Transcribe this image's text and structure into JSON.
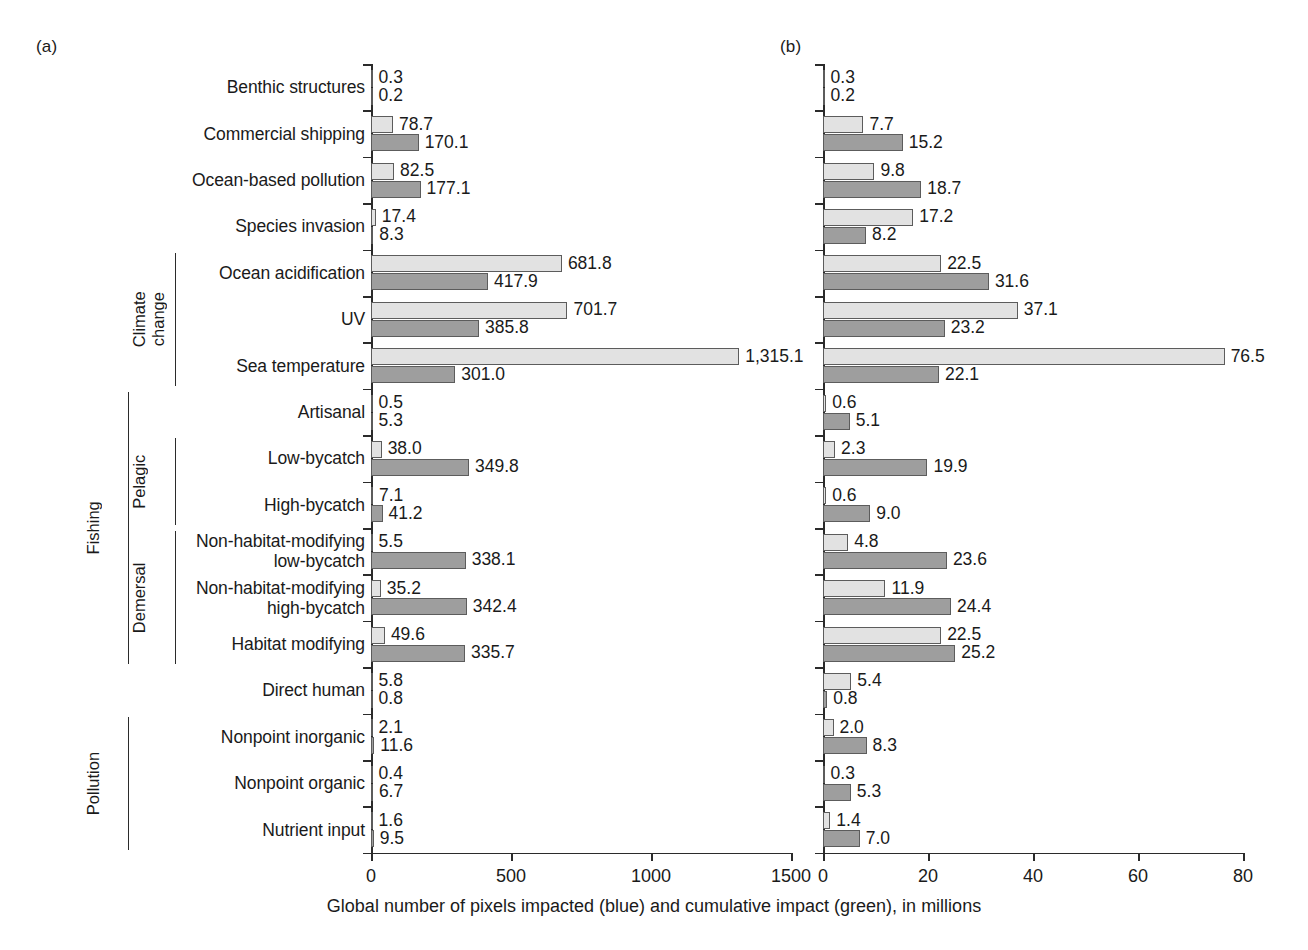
{
  "panels": {
    "a": {
      "letter": "(a)"
    },
    "b": {
      "letter": "(b)"
    }
  },
  "axis_caption": "Global number of pixels impacted (blue) and cumulative impact (green), in millions",
  "group_brackets": [
    {
      "label": "Climate\nchange",
      "first": 4,
      "last": 6,
      "depth": 1
    },
    {
      "label": "Fishing",
      "first": 7,
      "last": 12,
      "depth": 0
    },
    {
      "label": "Pelagic",
      "first": 8,
      "last": 9,
      "depth": 1
    },
    {
      "label": "Demersal",
      "first": 10,
      "last": 12,
      "depth": 1
    },
    {
      "label": "Pollution",
      "first": 14,
      "last": 16,
      "depth": 0
    }
  ],
  "chart_data": {
    "type": "bar",
    "title": "",
    "xlabel": "Global number of pixels impacted (blue) and cumulative impact (green), in millions",
    "ylabel": "",
    "orientation": "horizontal",
    "grid": false,
    "legend": "none",
    "categories": [
      "Benthic structures",
      "Commercial shipping",
      "Ocean-based pollution",
      "Species invasion",
      "Ocean acidification",
      "UV",
      "Sea temperature",
      "Artisanal",
      "Low-bycatch",
      "High-bycatch",
      "Non-habitat-modifying\nlow-bycatch",
      "Non-habitat-modifying\nhigh-bycatch",
      "Habitat modifying",
      "Direct human",
      "Nonpoint inorganic",
      "Nonpoint organic",
      "Nutrient input"
    ],
    "panels": [
      {
        "id": "a",
        "letter": "(a)",
        "xlim": [
          0,
          1500
        ],
        "xticks": [
          0,
          500,
          1000,
          1500
        ],
        "xticklabels": [
          "0",
          "500",
          "1000",
          "1500"
        ],
        "series": [
          {
            "name": "pixels-impacted",
            "color": "#e2e2e2",
            "values": [
              0.3,
              78.7,
              82.5,
              17.4,
              681.8,
              701.7,
              1315.1,
              0.5,
              38.0,
              7.1,
              5.5,
              35.2,
              49.6,
              5.8,
              2.1,
              0.4,
              1.6
            ],
            "labels": [
              "0.3",
              "78.7",
              "82.5",
              "17.4",
              "681.8",
              "701.7",
              "1,315.1",
              "0.5",
              "38.0",
              "7.1",
              "5.5",
              "35.2",
              "49.6",
              "5.8",
              "2.1",
              "0.4",
              "1.6"
            ]
          },
          {
            "name": "cumulative-impact",
            "color": "#9e9e9e",
            "values": [
              0.2,
              170.1,
              177.1,
              8.3,
              417.9,
              385.8,
              301.0,
              5.3,
              349.8,
              41.2,
              338.1,
              342.4,
              335.7,
              0.8,
              11.6,
              6.7,
              9.5
            ],
            "labels": [
              "0.2",
              "170.1",
              "177.1",
              "8.3",
              "417.9",
              "385.8",
              "301.0",
              "5.3",
              "349.8",
              "41.2",
              "338.1",
              "342.4",
              "335.7",
              "0.8",
              "11.6",
              "6.7",
              "9.5"
            ]
          }
        ]
      },
      {
        "id": "b",
        "letter": "(b)",
        "xlim": [
          0,
          80
        ],
        "xticks": [
          0,
          20,
          40,
          60,
          80
        ],
        "xticklabels": [
          "0",
          "20",
          "40",
          "60",
          "80"
        ],
        "series": [
          {
            "name": "pixels-impacted",
            "color": "#e2e2e2",
            "values": [
              0.3,
              7.7,
              9.8,
              17.2,
              22.5,
              37.1,
              76.5,
              0.6,
              2.3,
              0.6,
              4.8,
              11.9,
              22.5,
              5.4,
              2.0,
              0.3,
              1.4
            ],
            "labels": [
              "0.3",
              "7.7",
              "9.8",
              "17.2",
              "22.5",
              "37.1",
              "76.5",
              "0.6",
              "2.3",
              "0.6",
              "4.8",
              "11.9",
              "22.5",
              "5.4",
              "2.0",
              "0.3",
              "1.4"
            ]
          },
          {
            "name": "cumulative-impact",
            "color": "#9e9e9e",
            "values": [
              0.2,
              15.2,
              18.7,
              8.2,
              31.6,
              23.2,
              22.1,
              5.1,
              19.9,
              9.0,
              23.6,
              24.4,
              25.2,
              0.8,
              8.3,
              5.3,
              7.0
            ],
            "labels": [
              "0.2",
              "15.2",
              "18.7",
              "8.2",
              "31.6",
              "23.2",
              "22.1",
              "5.1",
              "19.9",
              "9.0",
              "23.6",
              "24.4",
              "25.2",
              "0.8",
              "8.3",
              "5.3",
              "7.0"
            ]
          }
        ]
      }
    ]
  }
}
